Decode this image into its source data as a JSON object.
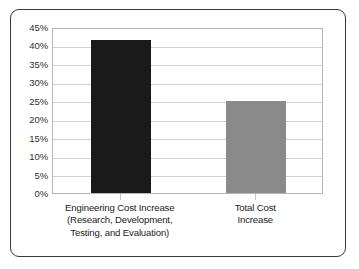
{
  "chart_data": {
    "type": "bar",
    "title": "",
    "subtitle": "",
    "xlabel": "",
    "ylabel": "",
    "categories": [
      "Engineering Cost Increase (Research, Development, Testing, and Evaluation)",
      "Total Cost Increase"
    ],
    "category_lines": [
      [
        "Engineering Cost Increase",
        "(Research, Development,",
        "Testing, and Evaluation)"
      ],
      [
        "Total Cost",
        "Increase"
      ]
    ],
    "values": [
      41.5,
      25
    ],
    "value_labels": [
      "41.5%",
      "25%"
    ],
    "bar_colors": [
      "#1a1a1a",
      "#8a8a8a"
    ],
    "ylim": [
      0,
      45
    ],
    "ytick_step": 5,
    "ytick_labels": [
      "45%",
      "40%",
      "35%",
      "30%",
      "25%",
      "20%",
      "15%",
      "10%",
      "5%",
      "0%"
    ],
    "ytick_values": [
      45,
      40,
      35,
      30,
      25,
      20,
      15,
      10,
      5,
      0
    ],
    "grid": true,
    "grid_color": "#d2d2d2",
    "legend": false,
    "legend_position": "none",
    "plot_border_color": "#b6b6b6",
    "frame_border_color": "#3a3a3a",
    "background_color": "#ffffff"
  }
}
